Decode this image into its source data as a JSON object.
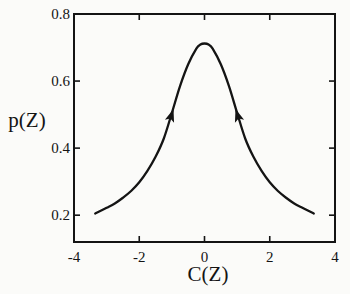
{
  "figure": {
    "background": "#fbfbf9",
    "ink_color": "#141414"
  },
  "chart_data": {
    "type": "line",
    "title": "",
    "xlabel": "C(Z)",
    "ylabel": "p(Z)",
    "xlim": [
      -4,
      4
    ],
    "ylim": [
      0.12,
      0.8
    ],
    "xticks": [
      -4,
      -2,
      0,
      2,
      4
    ],
    "yticks": [
      0.2,
      0.4,
      0.6,
      0.8
    ],
    "xtick_labels": [
      "-4",
      "-2",
      "0",
      "2",
      "4"
    ],
    "ytick_labels": [
      "0.2",
      "0.4",
      "0.6",
      "0.8"
    ],
    "grid": false,
    "tick_style": "inward-mirrored-all-sides",
    "series": [
      {
        "name": "p(Z) stationary density curve",
        "x": [
          -3.35,
          -3.0,
          -2.75,
          -2.5,
          -2.25,
          -2.0,
          -1.75,
          -1.5,
          -1.25,
          -1.0,
          -0.75,
          -0.5,
          -0.25,
          -0.125,
          0,
          0.125,
          0.25,
          0.5,
          0.75,
          1.0,
          1.25,
          1.5,
          1.75,
          2.0,
          2.25,
          2.5,
          2.75,
          3.0,
          3.35
        ],
        "y": [
          0.205,
          0.222,
          0.235,
          0.252,
          0.272,
          0.298,
          0.332,
          0.374,
          0.428,
          0.505,
          0.585,
          0.65,
          0.697,
          0.709,
          0.712,
          0.709,
          0.697,
          0.65,
          0.585,
          0.505,
          0.428,
          0.374,
          0.332,
          0.298,
          0.272,
          0.252,
          0.235,
          0.222,
          0.205
        ],
        "peak": {
          "x": 0,
          "y": 0.712
        }
      }
    ],
    "annotations": [
      {
        "type": "arrowhead",
        "x": -0.95,
        "y": 0.517,
        "angle_deg": -72,
        "points_toward": "peak"
      },
      {
        "type": "arrowhead",
        "x": 0.95,
        "y": 0.517,
        "angle_deg": -108,
        "points_toward": "peak"
      }
    ]
  }
}
